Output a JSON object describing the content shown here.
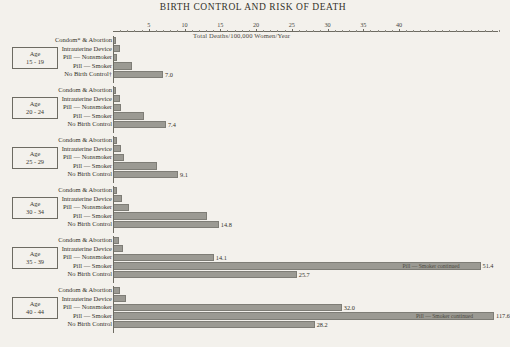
{
  "chart_data": {
    "type": "bar",
    "title": "BIRTH CONTROL AND RISK OF DEATH",
    "subtitle": "Total Deaths/100,000 Women/Year",
    "xlabel": "",
    "ylabel": "",
    "xlim": [
      0,
      54
    ],
    "grid": false,
    "orientation": "horizontal",
    "axis_ticks": [
      {
        "value": 5,
        "label": "5"
      },
      {
        "value": 10,
        "label": "10"
      },
      {
        "value": 15,
        "label": "15"
      },
      {
        "value": 20,
        "label": "20"
      },
      {
        "value": 25,
        "label": "25"
      },
      {
        "value": 30,
        "label": "30"
      },
      {
        "value": 35,
        "label": "35"
      },
      {
        "value": 40,
        "label": "40"
      }
    ],
    "categories": [
      "Condom* & Abortion",
      "Intrauterine Device",
      "Pill — Nonsmoker",
      "Pill — Smoker",
      "No Birth Control†"
    ],
    "series": [
      {
        "name": "Age 15-19",
        "values": [
          0.3,
          1.0,
          0.6,
          2.7,
          7.0
        ]
      },
      {
        "name": "Age 20-24",
        "values": [
          0.3,
          1.0,
          1.1,
          4.3,
          7.4
        ]
      },
      {
        "name": "Age 25-29",
        "values": [
          0.5,
          1.1,
          1.6,
          6.2,
          9.1
        ]
      },
      {
        "name": "Age 30-34",
        "values": [
          0.6,
          1.3,
          2.3,
          13.2,
          14.8
        ]
      },
      {
        "name": "Age 35-39",
        "values": [
          0.8,
          1.4,
          14.1,
          51.4,
          25.7
        ]
      },
      {
        "name": "Age 40-44",
        "values": [
          1.0,
          1.8,
          32.0,
          117.6,
          28.2
        ]
      }
    ]
  },
  "groups": [
    {
      "age_word": "Age",
      "age_range": "15 - 19",
      "rows": [
        {
          "label": "Condom* & Abortion",
          "value": 0.3,
          "value_label": ""
        },
        {
          "label": "Intrauterine Device",
          "value": 1.0,
          "value_label": ""
        },
        {
          "label": "Pill — Nonsmoker",
          "value": 0.6,
          "value_label": ""
        },
        {
          "label": "Pill — Smoker",
          "value": 2.7,
          "value_label": ""
        },
        {
          "label": "No Birth Control†",
          "value": 7.0,
          "value_label": "7.0"
        }
      ]
    },
    {
      "age_word": "Age",
      "age_range": "20 - 24",
      "rows": [
        {
          "label": "Condom & Abortion",
          "value": 0.3,
          "value_label": ""
        },
        {
          "label": "Intrauterine Device",
          "value": 1.0,
          "value_label": ""
        },
        {
          "label": "Pill — Nonsmoker",
          "value": 1.1,
          "value_label": ""
        },
        {
          "label": "Pill — Smoker",
          "value": 4.3,
          "value_label": ""
        },
        {
          "label": "No Birth Control",
          "value": 7.4,
          "value_label": "7.4"
        }
      ]
    },
    {
      "age_word": "Age",
      "age_range": "25 - 29",
      "rows": [
        {
          "label": "Condom & Abortion",
          "value": 0.5,
          "value_label": ""
        },
        {
          "label": "Intrauterine Device",
          "value": 1.1,
          "value_label": ""
        },
        {
          "label": "Pill — Nonsmoker",
          "value": 1.6,
          "value_label": ""
        },
        {
          "label": "Pill — Smoker",
          "value": 6.2,
          "value_label": ""
        },
        {
          "label": "No Birth Control",
          "value": 9.1,
          "value_label": "9.1"
        }
      ]
    },
    {
      "age_word": "Age",
      "age_range": "30 - 34",
      "rows": [
        {
          "label": "Condom & Abortion",
          "value": 0.6,
          "value_label": ""
        },
        {
          "label": "Intrauterine Device",
          "value": 1.3,
          "value_label": ""
        },
        {
          "label": "Pill — Nonsmoker",
          "value": 2.3,
          "value_label": ""
        },
        {
          "label": "Pill — Smoker",
          "value": 13.2,
          "value_label": ""
        },
        {
          "label": "No Birth Control",
          "value": 14.8,
          "value_label": "14.8"
        }
      ]
    },
    {
      "age_word": "Age",
      "age_range": "35 - 39",
      "rows": [
        {
          "label": "Condom & Abortion",
          "value": 0.8,
          "value_label": ""
        },
        {
          "label": "Intrauterine Device",
          "value": 1.4,
          "value_label": ""
        },
        {
          "label": "Pill — Nonsmoker",
          "value": 14.1,
          "value_label": "14.1"
        },
        {
          "label": "Pill — Smoker",
          "value": 51.4,
          "value_label": "51.4",
          "inner_note": "Pill — Smoker continued"
        },
        {
          "label": "No Birth Control",
          "value": 25.7,
          "value_label": "25.7"
        }
      ]
    },
    {
      "age_word": "Age",
      "age_range": "40 - 44",
      "rows": [
        {
          "label": "Condom & Abortion",
          "value": 1.0,
          "value_label": ""
        },
        {
          "label": "Intrauterine Device",
          "value": 1.8,
          "value_label": ""
        },
        {
          "label": "Pill — Nonsmoker",
          "value": 32.0,
          "value_label": "32.0"
        },
        {
          "label": "Pill — Smoker",
          "value": 117.6,
          "value_label": "117.6",
          "inner_note": "Pill — Smoker continued"
        },
        {
          "label": "No Birth Control",
          "value": 28.2,
          "value_label": "28.2"
        }
      ]
    }
  ]
}
